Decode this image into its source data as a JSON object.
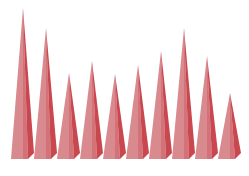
{
  "chart_data": {
    "type": "bar",
    "bar_shape": "3d-pyramid",
    "title": "",
    "xlabel": "",
    "ylabel": "",
    "grid": false,
    "legend": null,
    "categories": [
      "1",
      "2",
      "3",
      "4",
      "5",
      "6",
      "7",
      "8",
      "9",
      "10"
    ],
    "values": [
      151,
      131,
      86,
      98,
      85,
      94,
      108,
      131,
      103,
      66
    ],
    "ylim": [
      0,
      160
    ],
    "colors": {
      "front_face": "#d98a8f",
      "side_face": "#c9474f",
      "shadow": "#b83a42",
      "background": "#ffffff"
    }
  }
}
